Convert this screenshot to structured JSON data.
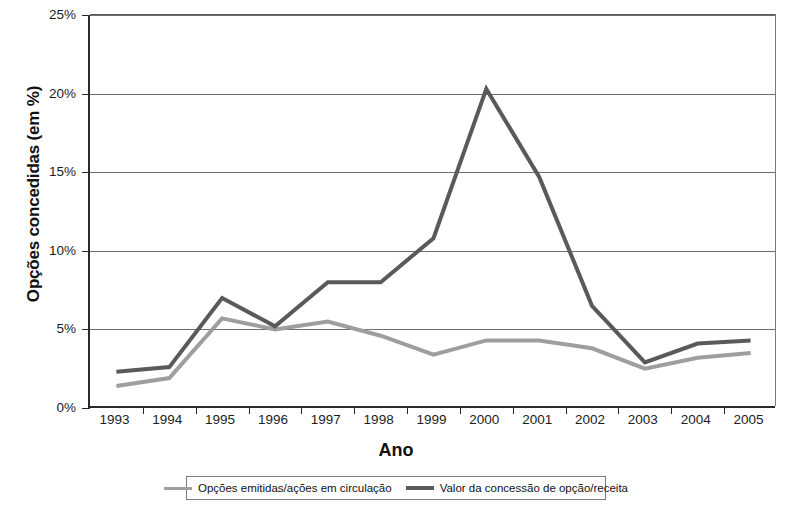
{
  "chart_data": {
    "type": "line",
    "title": "",
    "xlabel": "Ano",
    "ylabel": "Opções concedidas (em %)",
    "categories": [
      "1993",
      "1994",
      "1995",
      "1996",
      "1997",
      "1998",
      "1999",
      "2000",
      "2001",
      "2002",
      "2003",
      "2004",
      "2005"
    ],
    "x_tick_labels": [
      "1993",
      "1994",
      "1995",
      "1996",
      "1997",
      "1998",
      "1999",
      "2000",
      "2001",
      "2002",
      "2003",
      "2004",
      "2005"
    ],
    "y_tick_labels": [
      "0%",
      "5%",
      "10%",
      "15%",
      "20%",
      "25%"
    ],
    "y_tick_values": [
      0,
      5,
      10,
      15,
      20,
      25
    ],
    "ylim": [
      0,
      25
    ],
    "grid": "horizontal",
    "legend_position": "bottom",
    "series": [
      {
        "name": "Opções emitidas/ações em circulação",
        "color": "#9e9e9e",
        "values": [
          1.4,
          1.9,
          5.7,
          5.0,
          5.5,
          4.6,
          3.4,
          4.3,
          4.3,
          3.8,
          2.5,
          3.2,
          3.5
        ]
      },
      {
        "name": "Valor da concessão de opção/receita",
        "color": "#5a5a5a",
        "values": [
          2.3,
          2.6,
          7.0,
          5.2,
          8.0,
          8.0,
          10.8,
          20.3,
          14.7,
          6.5,
          2.9,
          4.1,
          4.3
        ]
      }
    ]
  },
  "axis": {
    "y_title": "Opções concedidas (em %)",
    "x_title": "Ano"
  },
  "legend": {
    "items": [
      {
        "label": "Opções emitidas/ações em circulação",
        "color": "#9e9e9e",
        "icon": "line-swatch-light"
      },
      {
        "label": "Valor da concessão de opção/receita",
        "color": "#5a5a5a",
        "icon": "line-swatch-dark"
      }
    ]
  }
}
